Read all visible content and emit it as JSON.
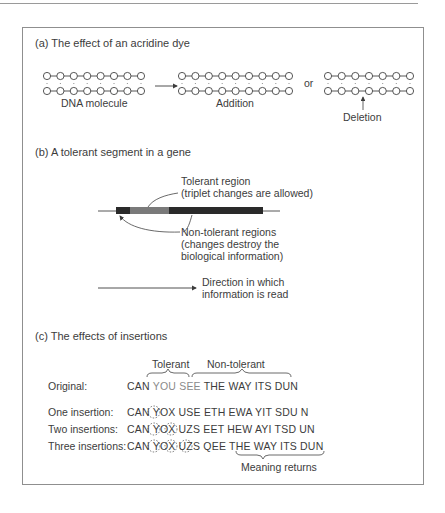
{
  "section_a": {
    "title": "(a) The effect of an acridine dye",
    "dna_label": "DNA molecule",
    "addition_label": "Addition",
    "or_label": "or",
    "deletion_label": "Deletion",
    "dna_counts": {
      "original": 8,
      "addition": 9,
      "deletion_top": 7,
      "deletion_bottom": 7
    }
  },
  "section_b": {
    "title": "(b) A tolerant segment in a gene",
    "tolerant_label_1": "Tolerant region",
    "tolerant_label_2": "(triplet changes are allowed)",
    "nontolerant_label_1": "Non-tolerant regions",
    "nontolerant_label_2": "(changes destroy the",
    "nontolerant_label_3": "biological information)",
    "direction_label_1": "Direction in which",
    "direction_label_2": "information is read"
  },
  "section_c": {
    "title": "(c) The effects of insertions",
    "brace_tolerant": "Tolerant",
    "brace_nontolerant": "Non-tolerant",
    "rows": [
      {
        "label": "Original:",
        "seq_a": "CAN ",
        "seq_b": "YOU SEE",
        "seq_c": " THE WAY ITS DUN"
      },
      {
        "label": "One insertion:",
        "seq": "CAN YOX USE ETH EWA YIT SDU N"
      },
      {
        "label": "Two insertions:",
        "seq": "CAN YOX UZS EET HEW AYI TSD UN"
      },
      {
        "label": "Three insertions:",
        "seq_a": "CAN YOX UZS QEE ",
        "seq_b": "THE WAY ITS DUN"
      }
    ],
    "meaning_label": "Meaning returns"
  },
  "colors": {
    "ink": "#3c3c3c",
    "tolerant_gray": "#8a8a8a",
    "bar_dark": "#2a2a2a",
    "bar_light": "#7a7a7a",
    "frame": "#8f8f8f"
  }
}
